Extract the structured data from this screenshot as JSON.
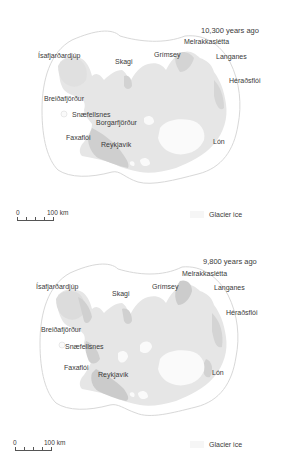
{
  "colors": {
    "background": "#ffffff",
    "land": "#e6e6e6",
    "lowland": "#cfcfcf",
    "glacier_ice": "#fafafa",
    "ice_margin_line": "#d8d8d8",
    "text": "#3a3a3a"
  },
  "panels": [
    {
      "title": "10,300 years ago",
      "place_labels": [
        {
          "name": "Ísafjarðardjúp"
        },
        {
          "name": "Skagi"
        },
        {
          "name": "Grímsey"
        },
        {
          "name": "Melrakkaslétta"
        },
        {
          "name": "Langanes"
        },
        {
          "name": "Héraðsflói"
        },
        {
          "name": "Breiðafjörður"
        },
        {
          "name": "Snæfellsnes"
        },
        {
          "name": "Borgarfjörður"
        },
        {
          "name": "Faxaflói"
        },
        {
          "name": "Reykjavík"
        },
        {
          "name": "Lón"
        }
      ],
      "scale": {
        "start": "0",
        "end": "100 km"
      },
      "legend": {
        "label": "Glacier ice"
      }
    },
    {
      "title": "9,800 years ago",
      "place_labels": [
        {
          "name": "Ísafjarðardjúp"
        },
        {
          "name": "Skagi"
        },
        {
          "name": "Grímsey"
        },
        {
          "name": "Melrakkaslétta"
        },
        {
          "name": "Langanes"
        },
        {
          "name": "Héraðsflói"
        },
        {
          "name": "Breiðafjörður"
        },
        {
          "name": "Snæfellsnes"
        },
        {
          "name": "Faxaflói"
        },
        {
          "name": "Reykjavík"
        },
        {
          "name": "Lón"
        }
      ],
      "scale": {
        "start": "0",
        "end": "100 km"
      },
      "legend": {
        "label": "Glacier ice"
      }
    }
  ]
}
